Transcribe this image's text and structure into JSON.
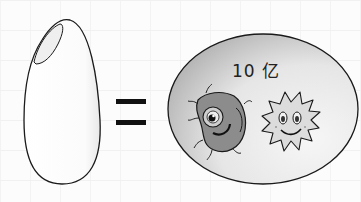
{
  "illustration": {
    "left_object": "rice-grain",
    "operator": "=",
    "right_object": "oval-containing-bacteria",
    "count_label": "10 亿",
    "characters": [
      "germ-character-gray",
      "virus-character-spiky"
    ]
  },
  "colors": {
    "outline": "#1a1a1a",
    "oval_fill_dark": "#bdbdbd",
    "oval_fill_light": "#f4f4f4",
    "germ_fill": "#8a8a8a",
    "virus_fill": "#dedede",
    "background": "#fcfcfc"
  }
}
